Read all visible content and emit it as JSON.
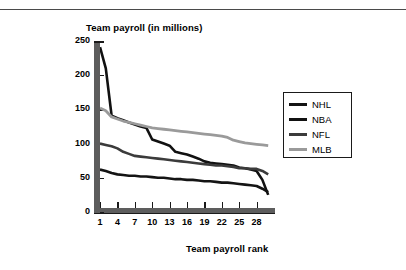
{
  "figure": {
    "name": "team-payroll-by-rank-chart",
    "background": "#ffffff",
    "rule_color": "#4a4a4a"
  },
  "chart_data": {
    "type": "line",
    "title": "",
    "xlabel": "Team payroll rank",
    "ylabel": "Team payroll (in millions)",
    "xlim": [
      1,
      31
    ],
    "ylim": [
      0,
      250
    ],
    "grid": false,
    "legend_position": "right",
    "xticks": [
      1,
      4,
      7,
      10,
      13,
      16,
      19,
      22,
      25,
      28
    ],
    "xtick_labels": [
      "1",
      "4",
      "7",
      "10",
      "13",
      "16",
      "19",
      "22",
      "25",
      "28"
    ],
    "yticks": [
      0,
      50,
      100,
      150,
      200,
      250
    ],
    "ytick_labels": [
      "0",
      "50",
      "100",
      "150",
      "200",
      "250"
    ],
    "x": [
      1,
      2,
      3,
      4,
      5,
      6,
      7,
      8,
      9,
      10,
      11,
      12,
      13,
      14,
      15,
      16,
      17,
      18,
      19,
      20,
      21,
      22,
      23,
      24,
      25,
      26,
      27,
      28,
      29,
      30
    ],
    "series": [
      {
        "name": "NHL",
        "color": "#141414",
        "width": 2.6,
        "values": [
          62,
          60,
          57,
          55,
          54,
          53,
          53,
          52,
          52,
          51,
          50,
          50,
          49,
          48,
          48,
          47,
          47,
          46,
          45,
          45,
          44,
          43,
          43,
          42,
          41,
          40,
          39,
          38,
          34,
          29
        ]
      },
      {
        "name": "NBA",
        "color": "#111111",
        "width": 2.6,
        "values": [
          241,
          210,
          141,
          137,
          134,
          131,
          128,
          125,
          123,
          106,
          103,
          100,
          97,
          88,
          86,
          84,
          81,
          78,
          74,
          72,
          71,
          70,
          69,
          68,
          65,
          64,
          62,
          60,
          47,
          25
        ]
      },
      {
        "name": "NFL",
        "color": "#3b3b3b",
        "width": 2.6,
        "values": [
          100,
          98,
          96,
          93,
          88,
          85,
          82,
          81,
          80,
          79,
          78,
          77,
          76,
          75,
          74,
          73,
          72,
          71,
          70,
          69,
          68,
          68,
          67,
          66,
          64,
          64,
          63,
          63,
          60,
          55
        ]
      },
      {
        "name": "MLB",
        "color": "#9a9a9a",
        "width": 2.8,
        "values": [
          152,
          148,
          139,
          136,
          133,
          131,
          129,
          127,
          125,
          123,
          122,
          121,
          120,
          119,
          118,
          117,
          116,
          115,
          114,
          113,
          112,
          111,
          109,
          105,
          103,
          101,
          100,
          99,
          98,
          97
        ]
      }
    ]
  },
  "legend": {
    "entries": [
      {
        "label": "NHL",
        "color": "#141414"
      },
      {
        "label": "NBA",
        "color": "#111111"
      },
      {
        "label": "NFL",
        "color": "#3b3b3b"
      },
      {
        "label": "MLB",
        "color": "#9a9a9a"
      }
    ]
  }
}
